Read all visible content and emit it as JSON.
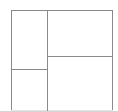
{
  "diagram": {
    "title": "",
    "line_color": "#8a8a8a",
    "background": "#ffffff",
    "outer_box": {
      "left": 11,
      "top": 10,
      "right": 112,
      "bottom": 110
    },
    "dividers": [
      {
        "name": "vertical-divider",
        "orientation": "vertical",
        "x": 47,
        "y1": 10,
        "y2": 111
      },
      {
        "name": "left-horizontal-divider",
        "orientation": "horizontal",
        "y": 69,
        "x1": 11,
        "x2": 47
      },
      {
        "name": "right-horizontal-divider",
        "orientation": "horizontal",
        "y": 56,
        "x1": 47,
        "x2": 112
      }
    ],
    "regions": [
      {
        "name": "top-left-panel",
        "label": ""
      },
      {
        "name": "bottom-left-panel",
        "label": ""
      },
      {
        "name": "top-right-panel",
        "label": ""
      },
      {
        "name": "bottom-right-panel",
        "label": ""
      }
    ]
  }
}
